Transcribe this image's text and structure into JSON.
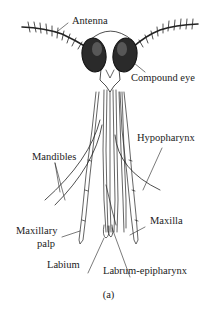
{
  "figure": {
    "caption": "(a)",
    "labels": {
      "antenna": "Antenna",
      "compound_eye": "Compound eye",
      "hypopharynx": "Hypopharynx",
      "mandibles": "Mandibles",
      "maxillary_palp_line1": "Maxillary",
      "maxillary_palp_line2": "palp",
      "maxilla": "Maxilla",
      "labium": "Labium",
      "labrum_epipharynx": "Labrum-epipharynx"
    },
    "colors": {
      "ink": "#222222",
      "background": "#ffffff"
    }
  }
}
